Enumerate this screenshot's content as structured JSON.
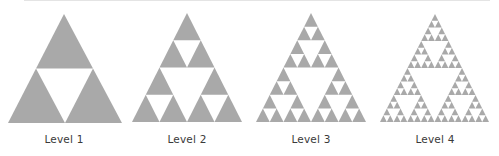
{
  "figure": {
    "fill_color": "#a9a9a9",
    "hole_color": "#ffffff",
    "panels": [
      {
        "label": "Level 1",
        "level": 1,
        "apex": [
          64,
          14
        ],
        "base_left": [
          8,
          123
        ],
        "base_right": [
          122,
          123
        ]
      },
      {
        "label": "Level 2",
        "level": 2,
        "apex": [
          187,
          13
        ],
        "base_left": [
          132,
          122
        ],
        "base_right": [
          242,
          122
        ]
      },
      {
        "label": "Level 3",
        "level": 3,
        "apex": [
          311,
          13
        ],
        "base_left": [
          256,
          122
        ],
        "base_right": [
          366,
          122
        ]
      },
      {
        "label": "Level 4",
        "level": 4,
        "apex": [
          435,
          14
        ],
        "base_left": [
          380,
          122
        ],
        "base_right": [
          489,
          122
        ]
      }
    ]
  }
}
